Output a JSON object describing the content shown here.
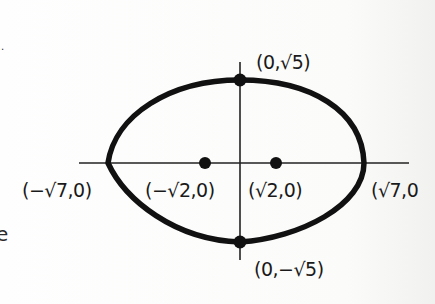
{
  "diagram": {
    "type": "ellipse",
    "colors": {
      "ink": "#111111",
      "background": "#fdfdfc"
    },
    "labels": {
      "top_covertex": "(0,√5)",
      "bottom_covertex": "(0,−√5)",
      "left_vertex": "(−√7,0)",
      "right_vertex": "(√7,0",
      "left_focus": "(−√2,0)",
      "right_focus": "(√2,0)"
    },
    "stray_marks": {
      "left_top": ".",
      "left_bottom": "e"
    }
  }
}
